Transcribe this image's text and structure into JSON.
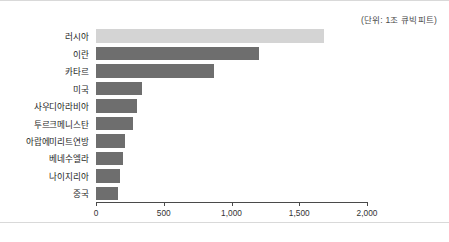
{
  "figure": {
    "unit_note": "(단위: 1조 큐빅피트)"
  },
  "chart_data": {
    "type": "bar",
    "orientation": "horizontal",
    "title": "",
    "subtitle": "",
    "xlabel": "",
    "ylabel": "",
    "unit_note": "(단위: 1조 큐빅피트)",
    "xlim": [
      0,
      2000
    ],
    "grid": false,
    "legend": "none",
    "tick_labels": [
      "0",
      "500",
      "1,000",
      "1,500",
      "2,000"
    ],
    "ticks": [
      0,
      500,
      1000,
      1500,
      2000
    ],
    "categories": [
      "러시아",
      "이란",
      "카타르",
      "미국",
      "사우디아라비아",
      "투르크메니스탄",
      "아랍에미리트연방",
      "베네수엘라",
      "나이지리아",
      "중국"
    ],
    "values": [
      1680,
      1200,
      870,
      340,
      300,
      270,
      215,
      200,
      180,
      165
    ],
    "colors": {
      "bar": "#6e6e6e",
      "highlight": "#d4d4d4",
      "axis": "#4a4a4a",
      "text": "#1e1e1e"
    },
    "highlight_index": 0,
    "bars": [
      {
        "label": "러시아",
        "value": 1680,
        "highlight": true
      },
      {
        "label": "이란",
        "value": 1200,
        "highlight": false
      },
      {
        "label": "카타르",
        "value": 870,
        "highlight": false
      },
      {
        "label": "미국",
        "value": 340,
        "highlight": false
      },
      {
        "label": "사우디아라비아",
        "value": 300,
        "highlight": false
      },
      {
        "label": "투르크메니스탄",
        "value": 270,
        "highlight": false
      },
      {
        "label": "아랍에미리트연방",
        "value": 215,
        "highlight": false
      },
      {
        "label": "베네수엘라",
        "value": 200,
        "highlight": false
      },
      {
        "label": "나이지리아",
        "value": 180,
        "highlight": false
      },
      {
        "label": "중국",
        "value": 165,
        "highlight": false
      }
    ]
  }
}
